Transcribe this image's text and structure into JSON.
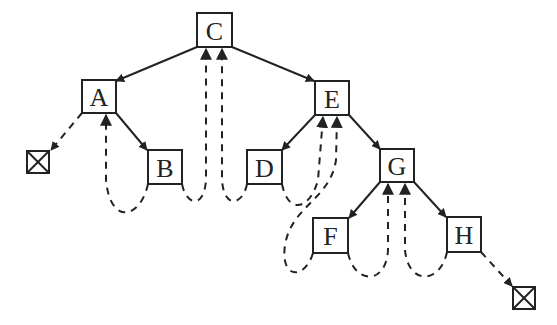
{
  "diagram": {
    "type": "threaded-binary-tree",
    "nodes": [
      {
        "id": "C",
        "label": "C",
        "x": 197,
        "y": 13,
        "w": 35,
        "h": 34
      },
      {
        "id": "A",
        "label": "A",
        "x": 82,
        "y": 80,
        "w": 34,
        "h": 33
      },
      {
        "id": "E",
        "label": "E",
        "x": 315,
        "y": 81,
        "w": 34,
        "h": 34
      },
      {
        "id": "B",
        "label": "B",
        "x": 148,
        "y": 150,
        "w": 34,
        "h": 34
      },
      {
        "id": "D",
        "label": "D",
        "x": 247,
        "y": 150,
        "w": 35,
        "h": 34
      },
      {
        "id": "G",
        "label": "G",
        "x": 380,
        "y": 149,
        "w": 34,
        "h": 33
      },
      {
        "id": "F",
        "label": "F",
        "x": 313,
        "y": 218,
        "w": 35,
        "h": 35
      },
      {
        "id": "H",
        "label": "H",
        "x": 447,
        "y": 217,
        "w": 34,
        "h": 35
      }
    ],
    "null_nodes": [
      {
        "id": "null-left",
        "x": 27,
        "y": 151,
        "w": 22,
        "h": 22
      },
      {
        "id": "null-right",
        "x": 513,
        "y": 287,
        "w": 22,
        "h": 22
      }
    ],
    "edges": [
      {
        "from": "C",
        "to": "A"
      },
      {
        "from": "C",
        "to": "E"
      },
      {
        "from": "A",
        "to": "B"
      },
      {
        "from": "E",
        "to": "D"
      },
      {
        "from": "E",
        "to": "G"
      },
      {
        "from": "G",
        "to": "F"
      },
      {
        "from": "G",
        "to": "H"
      }
    ],
    "threads": [
      {
        "from": "A",
        "to": "null-left",
        "kind": "left-thread"
      },
      {
        "from": "B",
        "to": "A",
        "kind": "left-thread"
      },
      {
        "from": "B",
        "to": "C",
        "kind": "right-thread"
      },
      {
        "from": "D",
        "to": "C",
        "kind": "left-thread"
      },
      {
        "from": "D",
        "to": "E",
        "kind": "right-thread"
      },
      {
        "from": "F",
        "to": "E",
        "kind": "left-thread"
      },
      {
        "from": "F",
        "to": "G",
        "kind": "right-thread"
      },
      {
        "from": "H",
        "to": "G",
        "kind": "left-thread"
      },
      {
        "from": "H",
        "to": "null-right",
        "kind": "right-thread"
      }
    ]
  }
}
